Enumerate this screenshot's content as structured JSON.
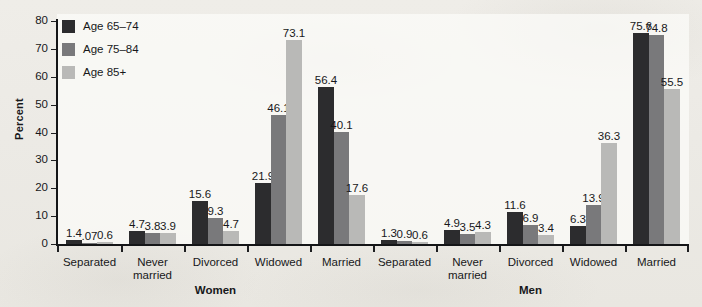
{
  "chart_data": {
    "type": "bar",
    "title": "",
    "xlabel": "",
    "ylabel": "Percent",
    "ylim": [
      0,
      80
    ],
    "ytick_step": 10,
    "yticks": [
      0,
      10,
      20,
      30,
      40,
      50,
      60,
      70,
      80
    ],
    "grid": false,
    "legend_position": "top-left",
    "legend": [
      "Age 65–74",
      "Age 75–84",
      "Age 85+"
    ],
    "series": [
      {
        "name": "Age 65–74",
        "color": "#2c2c2e",
        "values": [
          1.4,
          4.7,
          15.6,
          21.9,
          56.4,
          1.3,
          4.9,
          11.6,
          6.3,
          75.6
        ],
        "labels": [
          "1.4",
          "4.7",
          "15.6",
          "21.9",
          "56.4",
          "1.3",
          "4.9",
          "11.6",
          "6.3",
          "75.6"
        ]
      },
      {
        "name": "Age 75–84",
        "color": "#79797b",
        "values": [
          0.07,
          3.8,
          9.3,
          46.1,
          40.1,
          0.9,
          3.5,
          6.9,
          13.9,
          74.8
        ],
        "labels": [
          ".07",
          "3.8",
          "9.3",
          "46.1",
          "40.1",
          "0.9",
          "3.5",
          "6.9",
          "13.9",
          "74.8"
        ]
      },
      {
        "name": "Age 85+",
        "color": "#b9b9b7",
        "values": [
          0.6,
          3.9,
          4.7,
          73.1,
          17.6,
          0.6,
          4.3,
          3.4,
          36.3,
          55.5
        ],
        "labels": [
          "0.6",
          "3.9",
          "4.7",
          "73.1",
          "17.6",
          "0.6",
          "4.3",
          "3.4",
          "36.3",
          "55.5"
        ]
      }
    ],
    "categories": [
      "Separated",
      "Never\nmarried",
      "Divorced",
      "Widowed",
      "Married",
      "Separated",
      "Never\nmarried",
      "Divorced",
      "Widowed",
      "Married"
    ],
    "groups": [
      {
        "label": "Women",
        "categories": [
          0,
          1,
          2,
          3,
          4
        ]
      },
      {
        "label": "Men",
        "categories": [
          5,
          6,
          7,
          8,
          9
        ]
      }
    ]
  }
}
